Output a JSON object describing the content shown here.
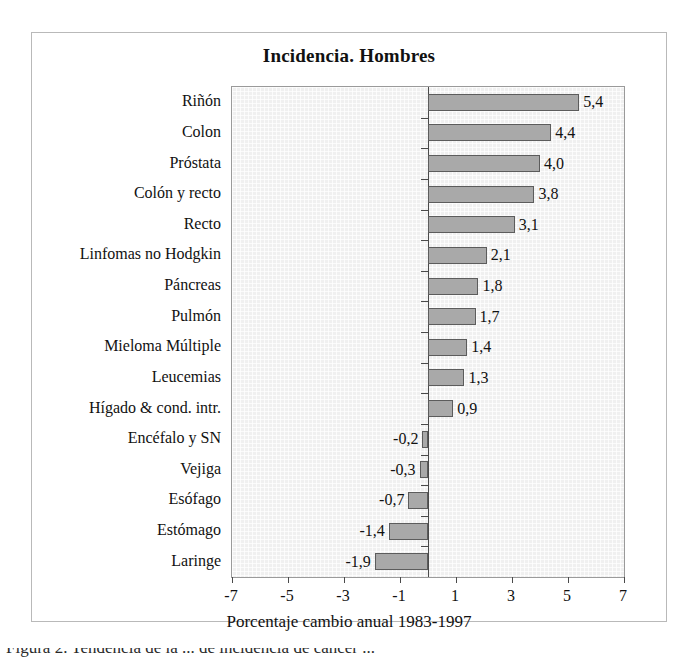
{
  "chart_data": {
    "type": "bar",
    "orientation": "horizontal",
    "title": "Incidencia. Hombres",
    "xlabel": "Porcentaje cambio anual 1983-1997",
    "ylabel": "",
    "xlim": [
      -7,
      7
    ],
    "xticks": [
      "-7",
      "-5",
      "-3",
      "-1",
      "1",
      "3",
      "5",
      "7"
    ],
    "xtick_values": [
      -7,
      -5,
      -3,
      -1,
      1,
      3,
      5,
      7
    ],
    "grid": false,
    "legend": null,
    "categories": [
      "Riñón",
      "Colon",
      "Próstata",
      "Colón y recto",
      "Recto",
      "Linfomas no Hodgkin",
      "Páncreas",
      "Pulmón",
      "Mieloma Múltiple",
      "Leucemias",
      "Hígado & cond. intr.",
      "Encéfalo y SN",
      "Vejiga",
      "Esófago",
      "Estómago",
      "Laringe"
    ],
    "values": [
      5.4,
      4.4,
      4.0,
      3.8,
      3.1,
      2.1,
      1.8,
      1.7,
      1.4,
      1.3,
      0.9,
      -0.2,
      -0.3,
      -0.7,
      -1.4,
      -1.9
    ],
    "value_labels": [
      "5,4",
      "4,4",
      "4,0",
      "3,8",
      "3,1",
      "2,1",
      "1,8",
      "1,7",
      "1,4",
      "1,3",
      "0,9",
      "-0,2",
      "-0,3",
      "-0,7",
      "-1,4",
      "-1,9"
    ],
    "bar_color": "#a9a9a9",
    "bar_edge_color": "#5c5c5c",
    "plot_background": "#f0f0f0",
    "axis_color": "#4a4a4a"
  },
  "caption": {
    "clipped_text": "Figura 2.  Tendencia de la   ...  de incidencia de cáncer  ..."
  }
}
